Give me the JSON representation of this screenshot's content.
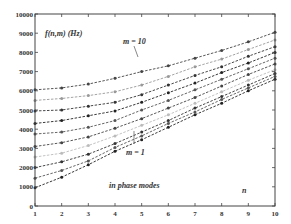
{
  "chart_data": {
    "type": "line",
    "title": "",
    "ylabel": "f(n,m) (Hz)",
    "xlabel": "n",
    "xlim": [
      1,
      10
    ],
    "ylim": [
      0,
      10000
    ],
    "x": [
      1,
      2,
      3,
      4,
      5,
      6,
      7,
      8,
      9,
      10
    ],
    "xticks": [
      "1",
      "2",
      "3",
      "4",
      "5",
      "6",
      "7",
      "8",
      "9",
      "10"
    ],
    "yticks": [
      "0",
      "1000",
      "2000",
      "3000",
      "4000",
      "5000",
      "6000",
      "7000",
      "8000",
      "9000",
      "10000"
    ],
    "grid": false,
    "annotations": [
      {
        "text": "m = 10",
        "x": 6.2,
        "y": 8600,
        "arrow_to": [
          6.5,
          7600
        ]
      },
      {
        "text": "m = 1",
        "x": 5.6,
        "y": 2400,
        "arrow_to": [
          5.6,
          3600
        ]
      },
      {
        "text": "in phase modes",
        "x": 3.3,
        "y": 1200
      },
      {
        "text": "n",
        "x": 8.8,
        "y": 750
      },
      {
        "text": "f(n,m) (Hz)",
        "x": 1.4,
        "y": 9100
      }
    ],
    "series": [
      {
        "name": "m = 1",
        "values": [
          950,
          1500,
          2150,
          2850,
          3450,
          4100,
          4750,
          5350,
          6000,
          6600
        ]
      },
      {
        "name": "m = 2",
        "values": [
          1450,
          1850,
          2350,
          3050,
          3650,
          4300,
          4900,
          5550,
          6150,
          6750
        ]
      },
      {
        "name": "m = 3",
        "values": [
          2000,
          2300,
          2700,
          3250,
          3850,
          4450,
          5100,
          5700,
          6300,
          6900
        ]
      },
      {
        "name": "m = 4",
        "values": [
          2550,
          2750,
          3150,
          3650,
          4200,
          4750,
          5350,
          5950,
          6550,
          7100
        ]
      },
      {
        "name": "m = 5",
        "values": [
          3100,
          3300,
          3600,
          4050,
          4550,
          5100,
          5650,
          6250,
          6850,
          7400
        ]
      },
      {
        "name": "m = 6",
        "values": [
          3750,
          3850,
          4100,
          4450,
          5000,
          5500,
          6050,
          6600,
          7150,
          7700
        ]
      },
      {
        "name": "m = 7",
        "values": [
          4300,
          4450,
          4700,
          4950,
          5400,
          5900,
          6400,
          6950,
          7450,
          8000
        ]
      },
      {
        "name": "m = 8",
        "values": [
          4950,
          5000,
          5200,
          5400,
          5800,
          6300,
          6800,
          7250,
          7800,
          8300
        ]
      },
      {
        "name": "m = 9",
        "values": [
          5500,
          5600,
          5750,
          5950,
          6300,
          6750,
          7250,
          7650,
          8150,
          8650
        ]
      },
      {
        "name": "m = 10",
        "values": [
          6050,
          6150,
          6350,
          6650,
          7000,
          7300,
          7700,
          8100,
          8550,
          9050
        ]
      }
    ],
    "series_colors": [
      "#222222",
      "#555555",
      "#333333",
      "#bbbbbb",
      "#444444",
      "#555555",
      "#222222",
      "#333333",
      "#999999",
      "#444444"
    ]
  }
}
